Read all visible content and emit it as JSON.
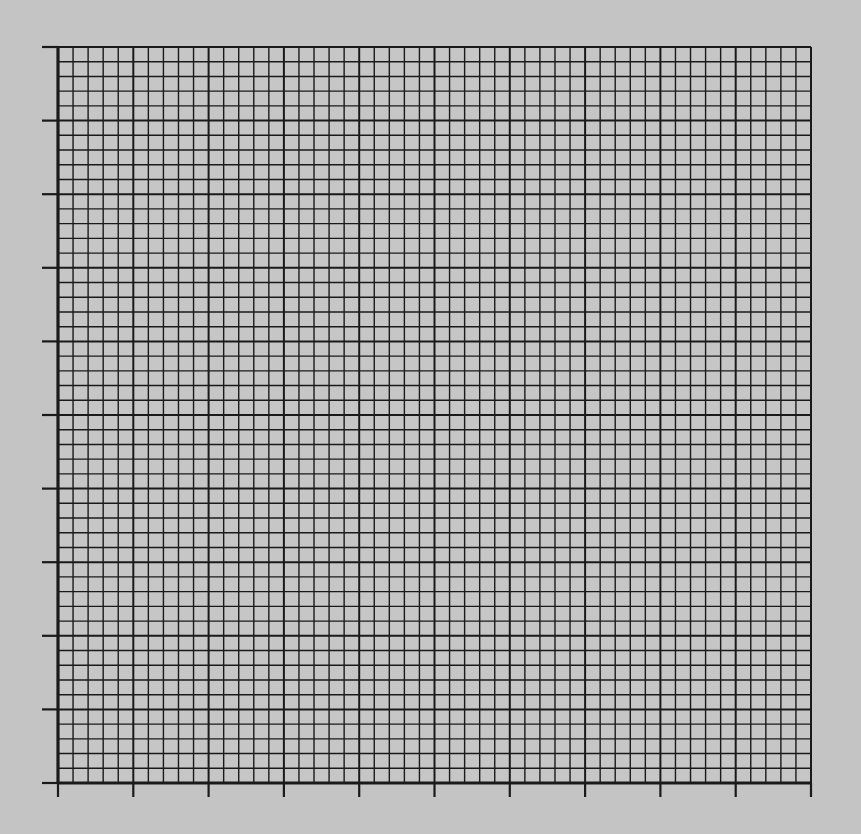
{
  "chart_data": {
    "type": "grid",
    "title": "",
    "xlabel": "",
    "ylabel": "",
    "x_major_divisions": 10,
    "y_major_divisions": 10,
    "minor_per_major": 5,
    "tick_labels_x": [],
    "tick_labels_y": [],
    "grid": true,
    "series": [],
    "colors": {
      "background": "#c4c4c4",
      "paper": "#c6c6c6",
      "line": "#1a1a1a"
    }
  },
  "layout": {
    "left": 58,
    "right": 811,
    "top": 47,
    "bottom": 783,
    "tick_len_left": 16,
    "tick_len_bottom": 14
  }
}
